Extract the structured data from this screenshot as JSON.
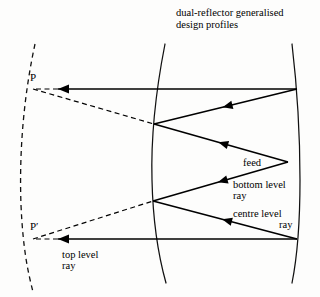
{
  "figure": {
    "title_line1": "dual-reflector generalised",
    "title_line2": "design profiles",
    "background_color": "#fdfdfc",
    "ink_color": "#000000"
  },
  "labels": {
    "feed": "feed",
    "bottom_level_ray_line1": "bottom level",
    "bottom_level_ray_line2": "ray",
    "centre_level_ray_line1": "centre level",
    "centre_level_ray_line2": "ray",
    "top_level_ray_line1": "top level",
    "top_level_ray_line2": "ray",
    "point_p": "P",
    "point_p_prime": "P′"
  },
  "chart_data": {
    "type": "diagram",
    "title": "dual-reflector generalised design profiles",
    "xlim": [
      0,
      320
    ],
    "ylim": [
      0,
      297
    ],
    "grid": false,
    "legend": "none",
    "curves": [
      {
        "name": "virtual-aperture-curve",
        "style": "dashed",
        "path": "M 35 44 C 24 95, 19 150, 21 205 C 23 250, 28 272, 33 292"
      },
      {
        "name": "sub-reflector-profile",
        "style": "solid",
        "path": "M 165 44 C 155 95, 151 145, 152 180 C 153 225, 159 258, 166 283"
      },
      {
        "name": "main-reflector-profile",
        "style": "solid",
        "path": "M 292 44 C 298 95, 300 150, 300 180 C 300 225, 297 258, 292 283"
      }
    ],
    "rays": [
      {
        "name": "top-level-ray-horizontal",
        "style": "solid",
        "arrow": "end",
        "points": [
          [
            297,
            89
          ],
          [
            58,
            89
          ]
        ]
      },
      {
        "name": "top-level-ray-virtual-extension",
        "style": "dashed",
        "arrow": "none",
        "points": [
          [
            58,
            89
          ],
          [
            33,
            89
          ]
        ]
      },
      {
        "name": "upper-sub-to-main-ray",
        "style": "solid",
        "arrow": "mid-left",
        "points": [
          [
            297,
            89
          ],
          [
            154,
            124
          ]
        ]
      },
      {
        "name": "upper-feed-to-sub-ray",
        "style": "solid",
        "arrow": "mid-left",
        "points": [
          [
            288,
            162
          ],
          [
            154,
            124
          ]
        ]
      },
      {
        "name": "lower-feed-to-sub-ray",
        "style": "solid",
        "arrow": "mid-left",
        "points": [
          [
            288,
            162
          ],
          [
            153,
            201
          ]
        ]
      },
      {
        "name": "lower-sub-to-main-ray",
        "style": "solid",
        "arrow": "mid-left",
        "points": [
          [
            297,
            239
          ],
          [
            153,
            201
          ]
        ]
      },
      {
        "name": "bottom-level-ray-horizontal",
        "style": "solid",
        "arrow": "end",
        "points": [
          [
            297,
            239
          ],
          [
            58,
            239
          ]
        ]
      },
      {
        "name": "bottom-level-ray-virtual-extension",
        "style": "dashed",
        "arrow": "none",
        "points": [
          [
            58,
            239
          ],
          [
            33,
            239
          ]
        ]
      },
      {
        "name": "p-to-sub-reflector-dashed",
        "style": "dashed",
        "arrow": "none",
        "points": [
          [
            33,
            89
          ],
          [
            154,
            124
          ]
        ]
      },
      {
        "name": "p-prime-to-sub-reflector-dashed",
        "style": "dashed",
        "arrow": "none",
        "points": [
          [
            33,
            239
          ],
          [
            153,
            201
          ]
        ]
      }
    ],
    "annotations": [
      {
        "name": "feed",
        "x": 243,
        "y": 166
      },
      {
        "name": "bottom-level-ray",
        "x": 233,
        "y": 188
      },
      {
        "name": "centre-level-ray",
        "x": 233,
        "y": 217
      },
      {
        "name": "top-level-ray",
        "x": 62,
        "y": 258
      },
      {
        "name": "point-p",
        "x": 30,
        "y": 81
      },
      {
        "name": "point-p-prime",
        "x": 30,
        "y": 230
      }
    ]
  }
}
